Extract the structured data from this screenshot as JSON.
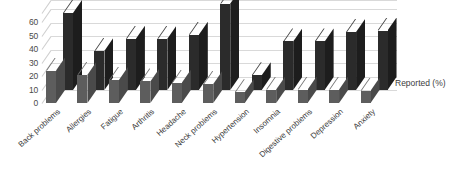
{
  "chart_data": {
    "type": "bar",
    "title": "",
    "subtitle": "",
    "xlabel": "",
    "ylabel": "",
    "ylim": [
      0,
      60
    ],
    "yticks": [
      60,
      50,
      40,
      30,
      20,
      10,
      0
    ],
    "grid": true,
    "legend_position": "right",
    "three_d": true,
    "categories": [
      "Back problems",
      "Allergies",
      "Fatigue",
      "Arthritis",
      "Headache",
      "Neck problems",
      "Hypertension",
      "Insomnia",
      "Digestive problems",
      "Depression",
      "Anxiety"
    ],
    "series": [
      {
        "name": "Reported (%)",
        "color": "#5d5d5d",
        "values": [
          24,
          21,
          17,
          16,
          15,
          14,
          8,
          10,
          10,
          10,
          9
        ]
      },
      {
        "name": "Reported (%)",
        "color": "#2b2b2b",
        "values": [
          57,
          29,
          38,
          38,
          41,
          64,
          11,
          36,
          36,
          43,
          44
        ]
      }
    ],
    "legend": [
      {
        "label": "Reported (%)",
        "color": "#2b2b2b"
      }
    ]
  },
  "legend": {
    "label": "Reported (%)"
  },
  "colors": {
    "front_series": "#5d5d5d",
    "back_series": "#2b2b2b",
    "gridline": "#d9d9d9",
    "text": "#3c3c3c",
    "background": "#ffffff"
  }
}
